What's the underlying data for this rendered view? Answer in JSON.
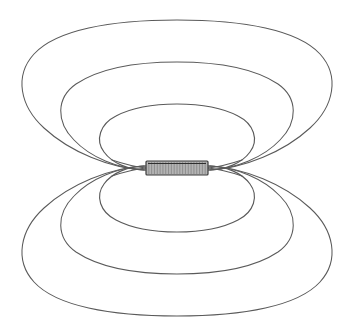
{
  "figure": {
    "title": "Magnetic field of a current-carrying coil (solenoid)",
    "caption": "",
    "background_color": "#ffffff",
    "line_color": "#5a5a5a",
    "coil_fill_color": "#b4b4b4",
    "coil_stroke_color": "#3a3a3a",
    "width": 355,
    "height": 331
  },
  "chart_data": {
    "type": "diagram",
    "title": "Magnetic field of a current-carrying coil (solenoid)",
    "subtitle": "",
    "xlabel": "",
    "ylabel": "",
    "legend": [],
    "annotations": [],
    "grid": false,
    "center": {
      "x": 177,
      "y": 168
    },
    "coil": {
      "name": "solenoid-coil",
      "x": 146,
      "y": 161,
      "width": 62,
      "height": 14,
      "fill": "#b4b4b4",
      "stroke": "#3a3a3a",
      "winding_count": 22
    },
    "field_loops_upper": [
      {
        "name": "inner-loop-upper",
        "rx": 71,
        "ry": 29,
        "cy": 139,
        "top_y": 110
      },
      {
        "name": "middle-loop-upper",
        "rx": 115,
        "ry": 50,
        "cy": 117,
        "top_y": 67
      },
      {
        "name": "outer-loop-upper",
        "rx": 160,
        "ry": 72,
        "cy": 96,
        "top_y": 24
      }
    ],
    "field_loops_lower": [
      {
        "name": "inner-loop-lower",
        "rx": 71,
        "ry": 29,
        "cy": 197,
        "bottom_y": 226
      },
      {
        "name": "middle-loop-lower",
        "rx": 115,
        "ry": 50,
        "cy": 219,
        "bottom_y": 269
      },
      {
        "name": "outer-loop-lower",
        "rx": 160,
        "ry": 72,
        "cy": 240,
        "bottom_y": 312
      }
    ]
  }
}
